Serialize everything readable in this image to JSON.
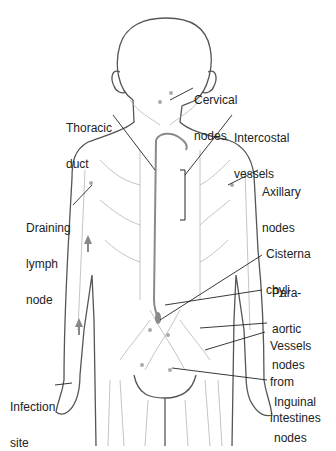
{
  "diagram": {
    "labels": {
      "cervical_nodes": [
        "Cervical",
        "nodes"
      ],
      "thoracic_duct": [
        "Thoracic",
        "duct"
      ],
      "intercostal_vessels": [
        "Intercostal",
        "vessels"
      ],
      "axillary_nodes": [
        "Axillary",
        "nodes"
      ],
      "draining_lymph_node": [
        "Draining",
        "lymph",
        "node"
      ],
      "cisterna_chyli": [
        "Cisterna",
        "chyli"
      ],
      "para_aortic_nodes": [
        "Para-",
        "aortic",
        "nodes"
      ],
      "vessels_from_intestines": [
        "Vessels",
        "from",
        "intestines"
      ],
      "infection_site": [
        "Infection",
        "site"
      ],
      "inguinal_nodes": [
        "Inguinal",
        "nodes"
      ]
    },
    "colors": {
      "outline": "#555555",
      "vessel": "#b0b0b0",
      "duct": "#8a8a8a",
      "leader": "#222222",
      "text": "#222222"
    }
  }
}
